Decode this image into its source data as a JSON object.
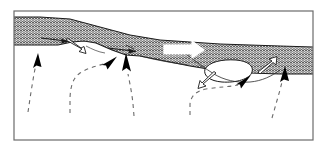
{
  "figure": {
    "type": "line-drawing-diagram",
    "background_color": "#ffffff",
    "frame": {
      "name": "figure-border",
      "stroke_color": "#6b6b6b",
      "fill_color": "#ffffff",
      "x": 14,
      "y": 11,
      "width": 299,
      "height": 129,
      "stroke_width": 1
    },
    "band": {
      "name": "hatched-shear-band",
      "description": "wavy-hatched tabular layer crossing the frame, thinning and stepping down to the right",
      "hatch_color": "#4a4a4a",
      "fill_color": "#ffffff",
      "outline_color": "#1a1a1a",
      "top_edge_points": "14,17 40,17 70,19 100,27 130,35 160,40 190,42 220,44 250,45 280,46 313,47",
      "bottom_edge_points": "313,74 280,74 250,73 220,71 190,66 160,60 140,56 126,55 112,50 96,43 84,41 72,42 58,45 40,45 14,45"
    },
    "lens_bodies": [
      {
        "name": "white-lens-body-right",
        "description": "closed white lens/boudin outlined along the base of the band",
        "fill_color": "#ffffff",
        "outline_color": "#1a1a1a",
        "center_x": 228,
        "center_y": 70
      }
    ],
    "white_arrows": [
      {
        "name": "hollow-arrow-band-center",
        "label": "large hollow extension arrow",
        "direction": "right",
        "fill_color": "#ffffff",
        "outline_color": "#ffffff",
        "x": 168,
        "y": 48
      },
      {
        "name": "hollow-arrow-left-downward",
        "label": "open kinematic arrow, left flank",
        "direction": "down-right",
        "fill_color": "#ffffff",
        "outline_color": "#1a1a1a",
        "x": 76,
        "y": 46
      },
      {
        "name": "hollow-arrow-mid-down",
        "label": "open kinematic arrow below lens, pointing left-down",
        "direction": "left-down",
        "fill_color": "#ffffff",
        "outline_color": "#1a1a1a",
        "x": 210,
        "y": 83
      },
      {
        "name": "hollow-arrow-right-up",
        "label": "open kinematic arrow, right flank pointing up-right",
        "direction": "up-right",
        "fill_color": "#ffffff",
        "outline_color": "#1a1a1a",
        "x": 268,
        "y": 67
      }
    ],
    "black_arrows": [
      {
        "name": "black-arrow-1",
        "label": "ascending flow arrow, far left",
        "direction": "up",
        "fill_color": "#000000",
        "tip_x": 38,
        "tip_y": 55,
        "tail_x": 28,
        "tail_y": 112
      },
      {
        "name": "black-arrow-2",
        "label": "ascending flow arrow, left-center",
        "direction": "up-right",
        "tip_x": 115,
        "tip_y": 58,
        "tail_x": 70,
        "tail_y": 112,
        "fill_color": "#000000"
      },
      {
        "name": "black-arrow-3",
        "label": "ascending flow arrow, center",
        "direction": "up",
        "tip_x": 128,
        "tip_y": 56,
        "tail_x": 134,
        "tail_y": 115,
        "fill_color": "#000000"
      },
      {
        "name": "black-arrow-4",
        "label": "ascending flow arrow, right-center",
        "direction": "up-right",
        "tip_x": 249,
        "tip_y": 77,
        "tail_x": 190,
        "tail_y": 114,
        "fill_color": "#000000"
      },
      {
        "name": "black-arrow-5",
        "label": "ascending flow arrow, far right",
        "direction": "up",
        "tip_x": 285,
        "tip_y": 70,
        "tail_x": 272,
        "tail_y": 118,
        "fill_color": "#000000"
      }
    ],
    "band_internal_arrows": [
      {
        "name": "internal-shear-arrow-left",
        "label": "thin dark shear arrow inside band, left",
        "direction": "right",
        "x1": 41,
        "y1": 38,
        "x2": 68,
        "y2": 42,
        "color": "#1a1a1a"
      },
      {
        "name": "internal-shear-arrow-center",
        "label": "thin dark shear arrow inside band, center",
        "direction": "right",
        "x1": 108,
        "y1": 48,
        "x2": 136,
        "y2": 52,
        "color": "#1a1a1a"
      }
    ],
    "dashed_lines": {
      "name": "flow-trajectory-dashes",
      "color": "#6b6b6b",
      "dash_pattern": "4 4"
    }
  }
}
